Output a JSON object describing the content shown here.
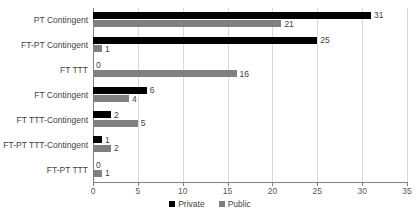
{
  "chart_data": {
    "type": "bar",
    "orientation": "horizontal",
    "title": "",
    "xlabel": "",
    "ylabel": "",
    "xlim": [
      0,
      35
    ],
    "xticks": [
      0,
      5,
      10,
      15,
      20,
      25,
      30,
      35
    ],
    "grid": true,
    "legend_position": "bottom",
    "categories": [
      "PT Contingent",
      "FT-PT Contingent",
      "FT TTT",
      "FT Contingent",
      "FT TTT-Contingent",
      "FT-PT TTT-Contingent",
      "FT-PT TTT"
    ],
    "series": [
      {
        "name": "Private",
        "color": "#000000",
        "values": [
          31,
          25,
          0,
          6,
          2,
          1,
          0
        ]
      },
      {
        "name": "Public",
        "color": "#808080",
        "values": [
          21,
          1,
          16,
          4,
          5,
          2,
          1
        ]
      }
    ]
  },
  "legend": {
    "items": [
      {
        "label": "Private",
        "swatch": "private"
      },
      {
        "label": "Public",
        "swatch": "public"
      }
    ]
  },
  "colors": {
    "private": "#000000",
    "public": "#808080",
    "gridline": "#d9d9d9",
    "axis": "#808080",
    "text": "#3f3f3f",
    "background": "#ffffff"
  }
}
